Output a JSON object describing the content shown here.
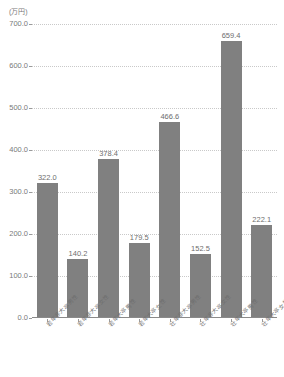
{
  "chart_data": {
    "type": "bar",
    "title": "",
    "subtitle": "",
    "unit_label": "(万円)",
    "xlabel": "",
    "ylabel": "",
    "ylim": [
      0,
      700
    ],
    "ytick_step": 100,
    "grid": true,
    "legend": "none",
    "bar_color": "#808080",
    "categories": [
      "若年非大卒男性",
      "若年非大卒女性",
      "若年大卒男性",
      "若年大卒女性",
      "壮年非大卒男性",
      "壮年非大卒女性",
      "壮年大卒男性",
      "壮年大卒女性"
    ],
    "values": [
      322.0,
      140.2,
      378.4,
      179.5,
      466.6,
      152.5,
      659.4,
      222.1
    ],
    "value_labels": [
      "322.0",
      "140.2",
      "378.4",
      "179.5",
      "466.6",
      "152.5",
      "659.4",
      "222.1"
    ],
    "ytick_labels": [
      "0.0",
      "100.0",
      "200.0",
      "300.0",
      "400.0",
      "500.0",
      "600.0",
      "700.0"
    ],
    "ytick_values": [
      0,
      100,
      200,
      300,
      400,
      500,
      600,
      700
    ]
  }
}
